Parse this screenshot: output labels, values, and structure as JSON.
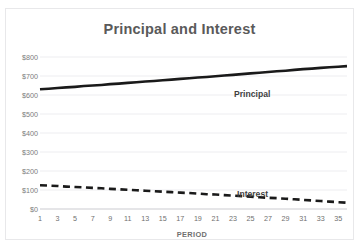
{
  "chart_data": {
    "type": "line",
    "title": "Principal and Interest",
    "xlabel": "PERIOD",
    "ylabel": "",
    "ylim": [
      0,
      800
    ],
    "xlim": [
      1,
      36
    ],
    "grid": true,
    "legend_position": "inline-data-labels",
    "y_ticks": [
      "$0",
      "$100",
      "$200",
      "$300",
      "$400",
      "$500",
      "$600",
      "$700",
      "$800"
    ],
    "y_tick_values": [
      0,
      100,
      200,
      300,
      400,
      500,
      600,
      700,
      800
    ],
    "x_ticks": [
      "1",
      "3",
      "5",
      "7",
      "9",
      "11",
      "13",
      "15",
      "17",
      "19",
      "21",
      "23",
      "25",
      "27",
      "29",
      "31",
      "33",
      "35"
    ],
    "x_tick_values": [
      1,
      3,
      5,
      7,
      9,
      11,
      13,
      15,
      17,
      19,
      21,
      23,
      25,
      27,
      29,
      31,
      33,
      35
    ],
    "x": [
      1,
      2,
      3,
      4,
      5,
      6,
      7,
      8,
      9,
      10,
      11,
      12,
      13,
      14,
      15,
      16,
      17,
      18,
      19,
      20,
      21,
      22,
      23,
      24,
      25,
      26,
      27,
      28,
      29,
      30,
      31,
      32,
      33,
      34,
      35,
      36
    ],
    "series": [
      {
        "name": "Principal",
        "style": "solid",
        "color": "#1a1a1a",
        "values": [
          630,
          633,
          637,
          640,
          643,
          647,
          650,
          653,
          657,
          660,
          664,
          667,
          671,
          674,
          678,
          681,
          685,
          688,
          692,
          695,
          699,
          703,
          706,
          710,
          714,
          717,
          721,
          725,
          728,
          732,
          736,
          739,
          743,
          746,
          749,
          752
        ]
      },
      {
        "name": "Interest",
        "style": "dashed",
        "color": "#1a1a1a",
        "values": [
          125,
          123,
          121,
          118,
          116,
          114,
          111,
          109,
          106,
          104,
          101,
          99,
          96,
          94,
          91,
          89,
          86,
          84,
          81,
          78,
          76,
          73,
          70,
          68,
          65,
          62,
          59,
          57,
          54,
          51,
          48,
          45,
          42,
          39,
          36,
          33
        ]
      }
    ],
    "annotations": [
      {
        "text": "Principal",
        "series": "Principal"
      },
      {
        "text": "Interest",
        "series": "Interest"
      }
    ]
  }
}
